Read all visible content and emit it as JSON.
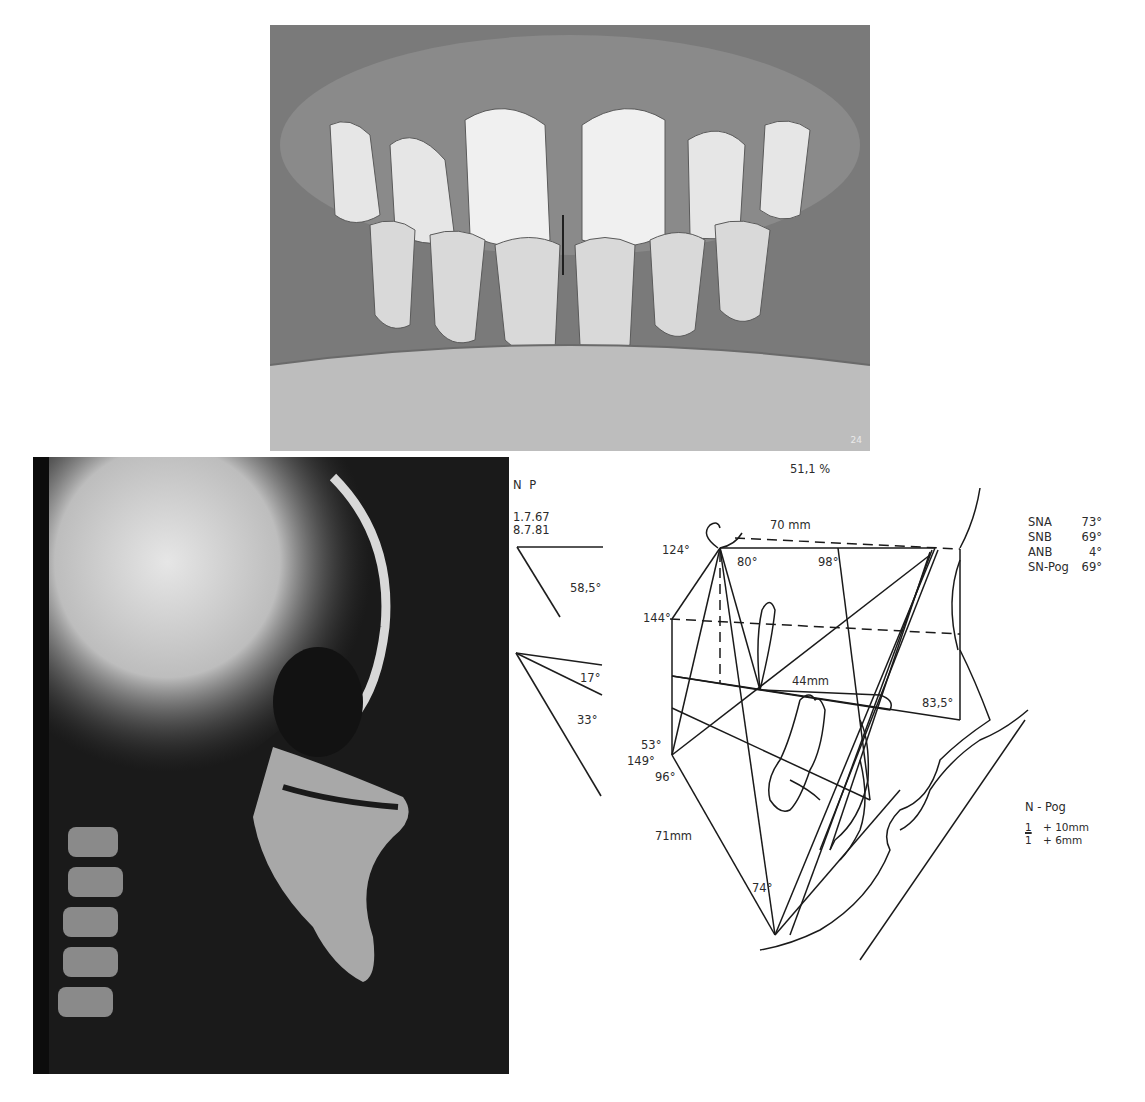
{
  "figures": {
    "intraoral_photo": {
      "label": "frontal-intraoral-photograph",
      "corner_mark": "24"
    },
    "cephalogram": {
      "label": "lateral-cephalometric-radiograph"
    },
    "tracing": {
      "percentage": "51,1 %",
      "np_block": {
        "title": "N  P",
        "date1": "1.7.67",
        "date2": "8.7.81",
        "angle_np": "58,5°",
        "angle_a": "17°",
        "angle_b": "33°"
      },
      "labels": {
        "top_distance": "70 mm",
        "a124": "124°",
        "a80": "80°",
        "a98": "98°",
        "a144": "144°",
        "d44": "44mm",
        "a835": "83,5°",
        "a53": "53°",
        "a149": "149°",
        "a96": "96°",
        "d71": "71mm",
        "a74": "74°"
      },
      "angles_table": [
        {
          "name": "SNA",
          "value": "73°"
        },
        {
          "name": "SNB",
          "value": "69°"
        },
        {
          "name": "ANB",
          "value": "4°"
        },
        {
          "name": "SN-Pog",
          "value": "69°"
        }
      ],
      "incisor_block": {
        "title": "N - Pog",
        "upper_symbol": "1",
        "upper_value": "+ 10mm",
        "lower_symbol": "1",
        "lower_value": "+  6mm"
      }
    }
  }
}
